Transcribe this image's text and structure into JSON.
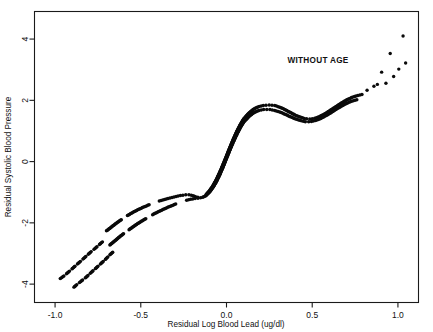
{
  "figure": {
    "name": "residual-blood-pressure-vs-blood-lead-scatter",
    "background_color": "#ffffff",
    "ink_color": "#0a0a0a"
  },
  "annotation": {
    "label": "WITHOUT AGE"
  },
  "axes": {
    "x_title": "Residual Log Blood Lead (ug/dl)",
    "y_title": "Residual Systolic Blood Pressure",
    "x_ticks": [
      "-1.0",
      "-0.5",
      "0.0",
      "0.5",
      "1.0"
    ],
    "y_ticks": [
      "4",
      "2",
      "0",
      "-2",
      "-4"
    ]
  },
  "chart_data": {
    "type": "scatter",
    "title": "",
    "subtitle": "",
    "xlabel": "Residual Log Blood Lead (ug/dl)",
    "ylabel": "Residual Systolic Blood Pressure",
    "xlim": [
      -1.12,
      1.12
    ],
    "ylim": [
      -4.6,
      4.9
    ],
    "xticks": [
      -1.0,
      -0.5,
      0.0,
      0.5,
      1.0
    ],
    "yticks": [
      4,
      2,
      0,
      -2,
      -4
    ],
    "grid": false,
    "legend": "none",
    "annotations": [
      {
        "text": "WITHOUT AGE",
        "x": 0.62,
        "y": 3.45
      }
    ],
    "series": [
      {
        "name": "upper-confidence-band",
        "style": "dotted-band",
        "points": [
          [
            -0.7,
            -2.26
          ],
          [
            -0.67,
            -2.13
          ],
          [
            -0.64,
            -2.0
          ],
          [
            -0.61,
            -1.88
          ],
          [
            -0.58,
            -1.77
          ],
          [
            -0.55,
            -1.67
          ],
          [
            -0.52,
            -1.58
          ],
          [
            -0.49,
            -1.5
          ],
          [
            -0.46,
            -1.43
          ],
          [
            -0.43,
            -1.36
          ],
          [
            -0.4,
            -1.3
          ],
          [
            -0.37,
            -1.25
          ],
          [
            -0.34,
            -1.2
          ],
          [
            -0.31,
            -1.16
          ],
          [
            -0.28,
            -1.12
          ],
          [
            -0.25,
            -1.09
          ],
          [
            -0.22,
            -1.08
          ],
          [
            -0.2,
            -1.1
          ],
          [
            -0.18,
            -1.15
          ],
          [
            -0.16,
            -1.17
          ],
          [
            -0.14,
            -1.15
          ],
          [
            -0.12,
            -1.08
          ],
          [
            -0.1,
            -0.96
          ],
          [
            -0.08,
            -0.8
          ],
          [
            -0.06,
            -0.6
          ],
          [
            -0.04,
            -0.36
          ],
          [
            -0.02,
            -0.1
          ],
          [
            0.0,
            0.18
          ],
          [
            0.02,
            0.46
          ],
          [
            0.04,
            0.73
          ],
          [
            0.06,
            0.98
          ],
          [
            0.08,
            1.2
          ],
          [
            0.1,
            1.39
          ],
          [
            0.13,
            1.58
          ],
          [
            0.16,
            1.72
          ],
          [
            0.19,
            1.8
          ],
          [
            0.22,
            1.84
          ],
          [
            0.25,
            1.85
          ],
          [
            0.28,
            1.83
          ],
          [
            0.31,
            1.78
          ],
          [
            0.34,
            1.7
          ],
          [
            0.37,
            1.61
          ],
          [
            0.4,
            1.52
          ],
          [
            0.43,
            1.45
          ],
          [
            0.46,
            1.4
          ],
          [
            0.49,
            1.39
          ],
          [
            0.52,
            1.42
          ],
          [
            0.55,
            1.49
          ],
          [
            0.58,
            1.58
          ],
          [
            0.61,
            1.69
          ],
          [
            0.64,
            1.8
          ],
          [
            0.67,
            1.91
          ],
          [
            0.7,
            2.01
          ],
          [
            0.73,
            2.09
          ],
          [
            0.76,
            2.15
          ],
          [
            0.79,
            2.19
          ]
        ]
      },
      {
        "name": "lower-confidence-band",
        "style": "dotted-band",
        "points": [
          [
            -0.68,
            -2.72
          ],
          [
            -0.65,
            -2.58
          ],
          [
            -0.62,
            -2.44
          ],
          [
            -0.59,
            -2.31
          ],
          [
            -0.56,
            -2.19
          ],
          [
            -0.53,
            -2.07
          ],
          [
            -0.5,
            -1.96
          ],
          [
            -0.47,
            -1.86
          ],
          [
            -0.44,
            -1.76
          ],
          [
            -0.41,
            -1.67
          ],
          [
            -0.38,
            -1.59
          ],
          [
            -0.35,
            -1.51
          ],
          [
            -0.32,
            -1.44
          ],
          [
            -0.29,
            -1.37
          ],
          [
            -0.26,
            -1.31
          ],
          [
            -0.23,
            -1.26
          ],
          [
            -0.2,
            -1.22
          ],
          [
            -0.18,
            -1.2
          ],
          [
            -0.16,
            -1.19
          ],
          [
            -0.14,
            -1.17
          ],
          [
            -0.12,
            -1.11
          ],
          [
            -0.1,
            -1.0
          ],
          [
            -0.08,
            -0.85
          ],
          [
            -0.06,
            -0.66
          ],
          [
            -0.04,
            -0.43
          ],
          [
            -0.02,
            -0.17
          ],
          [
            0.0,
            0.11
          ],
          [
            0.02,
            0.39
          ],
          [
            0.04,
            0.65
          ],
          [
            0.06,
            0.89
          ],
          [
            0.08,
            1.11
          ],
          [
            0.1,
            1.29
          ],
          [
            0.13,
            1.47
          ],
          [
            0.16,
            1.6
          ],
          [
            0.19,
            1.67
          ],
          [
            0.22,
            1.7
          ],
          [
            0.25,
            1.7
          ],
          [
            0.28,
            1.67
          ],
          [
            0.31,
            1.62
          ],
          [
            0.34,
            1.55
          ],
          [
            0.37,
            1.47
          ],
          [
            0.4,
            1.4
          ],
          [
            0.43,
            1.34
          ],
          [
            0.46,
            1.3
          ],
          [
            0.49,
            1.3
          ],
          [
            0.52,
            1.34
          ],
          [
            0.55,
            1.41
          ],
          [
            0.58,
            1.5
          ],
          [
            0.61,
            1.6
          ],
          [
            0.64,
            1.71
          ],
          [
            0.67,
            1.81
          ],
          [
            0.7,
            1.9
          ],
          [
            0.73,
            1.97
          ],
          [
            0.76,
            2.02
          ]
        ]
      },
      {
        "name": "left-tail-upper",
        "style": "dotted-sparse",
        "points": [
          [
            -0.97,
            -3.82
          ],
          [
            -0.945,
            -3.72
          ],
          [
            -0.905,
            -3.52
          ],
          [
            -0.885,
            -3.42
          ],
          [
            -0.845,
            -3.22
          ],
          [
            -0.825,
            -3.12
          ],
          [
            -0.79,
            -2.94
          ],
          [
            -0.77,
            -2.85
          ],
          [
            -0.74,
            -2.7
          ],
          [
            -0.72,
            -2.6
          ]
        ]
      },
      {
        "name": "left-tail-lower",
        "style": "dotted-sparse",
        "points": [
          [
            -0.89,
            -4.1
          ],
          [
            -0.87,
            -4.0
          ],
          [
            -0.838,
            -3.86
          ],
          [
            -0.82,
            -3.78
          ],
          [
            -0.79,
            -3.62
          ],
          [
            -0.77,
            -3.52
          ],
          [
            -0.735,
            -3.34
          ],
          [
            -0.715,
            -3.24
          ],
          [
            -0.68,
            -3.04
          ],
          [
            -0.66,
            -2.94
          ]
        ]
      },
      {
        "name": "right-tail-scatter",
        "style": "dots",
        "points": [
          [
            0.82,
            2.33
          ],
          [
            0.86,
            2.46
          ],
          [
            0.88,
            2.52
          ],
          [
            0.905,
            2.92
          ],
          [
            0.93,
            2.56
          ],
          [
            0.955,
            3.53
          ],
          [
            0.975,
            2.78
          ],
          [
            1.005,
            3.02
          ],
          [
            1.03,
            4.1
          ],
          [
            1.045,
            3.22
          ]
        ]
      }
    ]
  }
}
